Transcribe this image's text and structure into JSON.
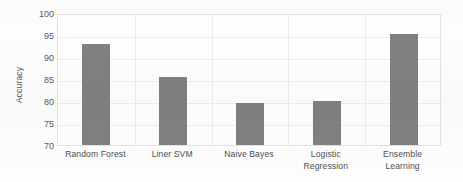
{
  "chart_data": {
    "type": "bar",
    "title": "",
    "xlabel": "",
    "ylabel": "Accuracy",
    "categories": [
      "Random Forest",
      "Liner SVM",
      "Naive Bayes",
      "Logistic Regression",
      "Ensemble Learning"
    ],
    "category_lines": [
      [
        "Random Forest"
      ],
      [
        "Liner SVM"
      ],
      [
        "Naive Bayes"
      ],
      [
        "Logistic",
        "Regression"
      ],
      [
        "Ensemble",
        "Learning"
      ]
    ],
    "values": [
      93.0,
      85.4,
      79.6,
      80.1,
      95.3
    ],
    "ylim": [
      70,
      100
    ],
    "ytick_values": [
      100,
      95,
      90,
      85,
      80,
      75,
      70
    ],
    "ytick_labels": [
      "100",
      "95",
      "90",
      "85",
      "80",
      "75",
      "70"
    ],
    "grid": true,
    "grid_axis": "both",
    "legend": false,
    "legend_position": "none",
    "bar_color": "#808083",
    "gridline_color": "#ededef",
    "plot_border_color": "#e2e2e4",
    "background_color": "#fdfdfd",
    "tick_label_color": "#5a5a5d",
    "axis_title_color": "#555558"
  }
}
